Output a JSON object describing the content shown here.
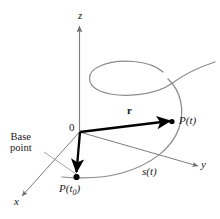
{
  "figure": {
    "background_color": "#ffffff",
    "axis_color": "#7d7d7d",
    "curve_color": "#8c8c8c",
    "vector_color": "#000000",
    "leader_color": "#9a9a9a",
    "axes": [
      {
        "name": "z-axis",
        "label": "z",
        "direction": "up"
      },
      {
        "name": "y-axis",
        "label": "y",
        "direction": "right-down"
      },
      {
        "name": "x-axis",
        "label": "x",
        "direction": "left-down"
      }
    ],
    "labels": {
      "z_axis": "z",
      "y_axis": "y",
      "x_axis": "x",
      "origin": "0",
      "vector_r": "r",
      "point_t": "P(t)",
      "point_t0_main": "P(t",
      "point_t0_sub": "0",
      "point_t0_close": ")",
      "arc_length_main": "s(t",
      "arc_length_close": ")",
      "base_point_line1": "Base",
      "base_point_line2": "point"
    },
    "points": [
      {
        "name": "point-P-t",
        "label": "P(t)",
        "x": 172,
        "y": 122
      },
      {
        "name": "point-P-t0",
        "label": "P(t0)",
        "x": 76,
        "y": 178
      }
    ],
    "vectors": [
      {
        "name": "vector-r",
        "label": "r",
        "from": "origin",
        "to": "P(t)"
      },
      {
        "name": "vector-base",
        "label": "",
        "from": "origin",
        "to": "P(t0)"
      }
    ]
  }
}
